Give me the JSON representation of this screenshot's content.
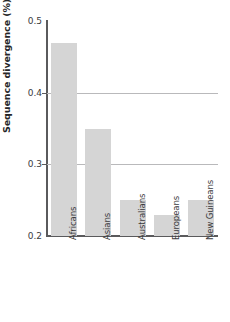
{
  "chart_data": {
    "type": "bar",
    "title": "",
    "xlabel": "",
    "ylabel": "Sequence divergence (%)",
    "categories": [
      "Africans",
      "Asians",
      "Australians",
      "Europeans",
      "New Guineans"
    ],
    "values": [
      0.47,
      0.35,
      0.25,
      0.23,
      0.25
    ],
    "ylim": [
      0.2,
      0.5
    ],
    "yticks": [
      "0.2",
      "0.3",
      "0.4",
      "0.5"
    ],
    "ytick_values": [
      0.2,
      0.3,
      0.4,
      0.5
    ],
    "gridlines_at": [
      0.3,
      0.4
    ],
    "grid": "horizontal-partial",
    "legend": "none",
    "bar_color": "#d5d5d5",
    "axis_color": "#5a5a5c",
    "grid_color": "#b9b9bb",
    "text_color": "#3b3b3d",
    "background_color": "#ffffff"
  }
}
